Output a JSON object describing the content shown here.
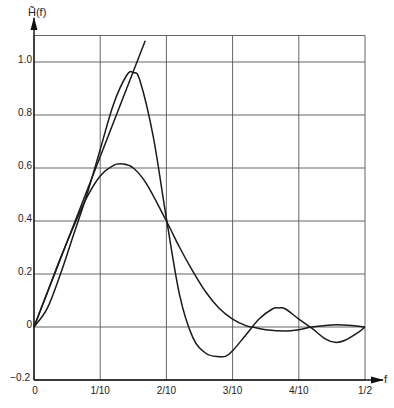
{
  "chart_data": {
    "type": "line",
    "title": "",
    "ylabel": "H̃(f)",
    "xlabel": "f",
    "xlim": [
      0,
      0.5
    ],
    "ylim": [
      -0.2,
      1.1
    ],
    "grid": true,
    "legend": "none",
    "x_ticks": [
      {
        "value": 0,
        "label": "0"
      },
      {
        "value": 0.1,
        "label": "1/10"
      },
      {
        "value": 0.2,
        "label": "2/10"
      },
      {
        "value": 0.3,
        "label": "3/10"
      },
      {
        "value": 0.4,
        "label": "4/10"
      },
      {
        "value": 0.5,
        "label": "1/2"
      }
    ],
    "y_ticks": [
      {
        "value": -0.2,
        "label": "−0.2"
      },
      {
        "value": 0,
        "label": "0"
      },
      {
        "value": 0.2,
        "label": "0.2"
      },
      {
        "value": 0.4,
        "label": "0.4"
      },
      {
        "value": 0.6,
        "label": "0.6"
      },
      {
        "value": 0.8,
        "label": "0.8"
      },
      {
        "value": 1.0,
        "label": "1.0"
      }
    ],
    "series": [
      {
        "name": "ideal linear response",
        "x": [
          0,
          0.168
        ],
        "y": [
          0,
          1.08
        ]
      },
      {
        "name": "high-peak response",
        "x": [
          0,
          0.02,
          0.04,
          0.06,
          0.08,
          0.1,
          0.12,
          0.14,
          0.15,
          0.16,
          0.18,
          0.2,
          0.22,
          0.24,
          0.26,
          0.28,
          0.29,
          0.3,
          0.32,
          0.34,
          0.36,
          0.37,
          0.38,
          0.4,
          0.42,
          0.44,
          0.455,
          0.47,
          0.49,
          0.5
        ],
        "y": [
          0,
          0.07,
          0.2,
          0.35,
          0.5,
          0.67,
          0.84,
          0.95,
          0.96,
          0.93,
          0.72,
          0.41,
          0.12,
          -0.04,
          -0.1,
          -0.112,
          -0.11,
          -0.09,
          -0.03,
          0.03,
          0.068,
          0.072,
          0.068,
          0.03,
          -0.005,
          -0.045,
          -0.058,
          -0.05,
          -0.02,
          0
        ]
      },
      {
        "name": "smooth response",
        "x": [
          0,
          0.02,
          0.04,
          0.06,
          0.08,
          0.1,
          0.12,
          0.134,
          0.15,
          0.17,
          0.2,
          0.22,
          0.24,
          0.26,
          0.28,
          0.3,
          0.32,
          0.33,
          0.35,
          0.38,
          0.4,
          0.42,
          0.45,
          0.48,
          0.5
        ],
        "y": [
          0,
          0.13,
          0.26,
          0.38,
          0.49,
          0.57,
          0.61,
          0.615,
          0.6,
          0.54,
          0.4,
          0.3,
          0.21,
          0.13,
          0.07,
          0.03,
          0.005,
          0,
          -0.01,
          -0.015,
          -0.01,
          0,
          0.008,
          0.006,
          0
        ]
      }
    ],
    "colors": {
      "curve": "#1a1a1a",
      "grid": "#555555",
      "axis": "#111111",
      "text": "#222222"
    }
  }
}
